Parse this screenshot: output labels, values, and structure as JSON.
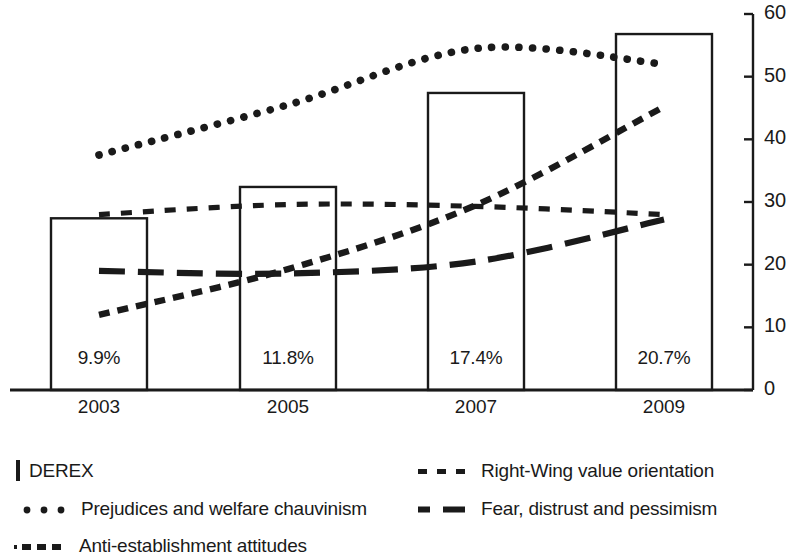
{
  "chart_data": {
    "type": "bar",
    "title": "",
    "subtitle": "",
    "xlabel": "",
    "ylabel": "",
    "categories": [
      "2003",
      "2005",
      "2007",
      "2009"
    ],
    "ylim": [
      0,
      60
    ],
    "y_ticks": [
      "0",
      "10",
      "20",
      "30",
      "40",
      "50",
      "60"
    ],
    "y_tick_values": [
      0,
      10,
      20,
      30,
      40,
      50,
      60
    ],
    "grid": false,
    "y_axis_position": "right",
    "legend_position": "bottom",
    "bars": {
      "name": "DEREX",
      "values": [
        27.4,
        32.4,
        47.4,
        56.8
      ],
      "data_labels": [
        "9.9%",
        "11.8%",
        "17.4%",
        "20.7%"
      ],
      "fill": "#ffffff",
      "stroke": "#1a1a1a"
    },
    "series": [
      {
        "name": "Prejudices and welfare chauvinism",
        "style": "dotted",
        "values": [
          37.5,
          45.5,
          54.5,
          52.0
        ],
        "color": "#1a1a1a"
      },
      {
        "name": "Right-Wing value orientation",
        "style": "dashed-fine",
        "values": [
          28.0,
          29.6,
          29.3,
          28.0
        ],
        "color": "#1a1a1a"
      },
      {
        "name": "Anti-establishment attitudes",
        "style": "dashed-square",
        "values": [
          12.0,
          19.3,
          29.5,
          45.2
        ],
        "color": "#1a1a1a"
      },
      {
        "name": "Fear, distrust and pessimism",
        "style": "dashed-long",
        "values": [
          19.0,
          18.6,
          20.5,
          27.2
        ],
        "color": "#1a1a1a"
      }
    ]
  },
  "legend": {
    "items": [
      {
        "label": "DEREX",
        "swatch": "box-outline-swatch"
      },
      {
        "label": "Right-Wing value orientation",
        "swatch": "fine-dash-swatch"
      },
      {
        "label": "Prejudices and welfare chauvinism",
        "swatch": "round-dot-swatch"
      },
      {
        "label": "Fear, distrust and pessimism",
        "swatch": "long-dash-swatch"
      },
      {
        "label": "Anti-establishment attitudes",
        "swatch": "square-dash-swatch"
      }
    ]
  }
}
